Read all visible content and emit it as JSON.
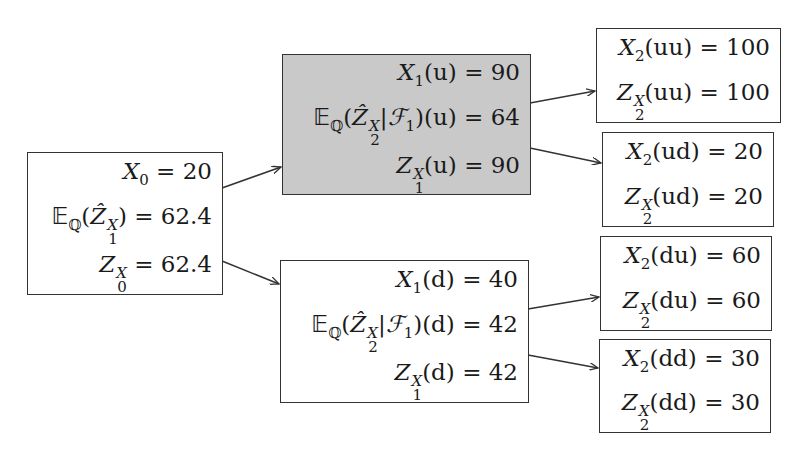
{
  "diagram": {
    "type": "binomial-tree",
    "nodes": {
      "root": {
        "lines": [
          {
            "lhs": "X",
            "sub": "0",
            "sup": "",
            "arg": "",
            "value": "20"
          },
          {
            "lhs": "E_Q(Ẑ^X_1)",
            "value": "62.4"
          },
          {
            "lhs": "Z",
            "sub": "0",
            "sup": "X",
            "arg": "",
            "value": "62.4"
          }
        ],
        "shaded": false
      },
      "u": {
        "lines": [
          {
            "lhs": "X",
            "sub": "1",
            "arg": "u",
            "value": "90"
          },
          {
            "lhs": "E_Q(Ẑ^X_2|F_1)(u)",
            "value": "64"
          },
          {
            "lhs": "Z",
            "sub": "1",
            "sup": "X",
            "arg": "u",
            "value": "90"
          }
        ],
        "shaded": true
      },
      "d": {
        "lines": [
          {
            "lhs": "X",
            "sub": "1",
            "arg": "d",
            "value": "40"
          },
          {
            "lhs": "E_Q(Ẑ^X_2|F_1)(d)",
            "value": "42"
          },
          {
            "lhs": "Z",
            "sub": "1",
            "sup": "X",
            "arg": "d",
            "value": "42"
          }
        ],
        "shaded": false
      },
      "uu": {
        "lines": [
          {
            "lhs": "X",
            "sub": "2",
            "arg": "uu",
            "value": "100"
          },
          {
            "lhs": "Z",
            "sub": "2",
            "sup": "X",
            "arg": "uu",
            "value": "100"
          }
        ]
      },
      "ud": {
        "lines": [
          {
            "lhs": "X",
            "sub": "2",
            "arg": "ud",
            "value": "20"
          },
          {
            "lhs": "Z",
            "sub": "2",
            "sup": "X",
            "arg": "ud",
            "value": "20"
          }
        ]
      },
      "du": {
        "lines": [
          {
            "lhs": "X",
            "sub": "2",
            "arg": "du",
            "value": "60"
          },
          {
            "lhs": "Z",
            "sub": "2",
            "sup": "X",
            "arg": "du",
            "value": "60"
          }
        ]
      },
      "dd": {
        "lines": [
          {
            "lhs": "X",
            "sub": "2",
            "arg": "dd",
            "value": "30"
          },
          {
            "lhs": "Z",
            "sub": "2",
            "sup": "X",
            "arg": "dd",
            "value": "30"
          }
        ]
      }
    },
    "edges": [
      [
        "root",
        "u"
      ],
      [
        "root",
        "d"
      ],
      [
        "u",
        "uu"
      ],
      [
        "u",
        "ud"
      ],
      [
        "d",
        "du"
      ],
      [
        "d",
        "dd"
      ]
    ],
    "colors": {
      "shaded_fill": "#c9c9c9",
      "border": "#333333"
    }
  }
}
